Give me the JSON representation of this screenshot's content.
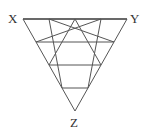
{
  "diagram": {
    "type": "triangular-grid",
    "subdivisions": 4,
    "stroke_color": "#555555",
    "vertices": {
      "X": {
        "label": "X",
        "x": 23,
        "y": 19
      },
      "Y": {
        "label": "Y",
        "x": 127,
        "y": 19
      },
      "Z": {
        "label": "Z",
        "x": 75,
        "y": 111
      }
    }
  }
}
